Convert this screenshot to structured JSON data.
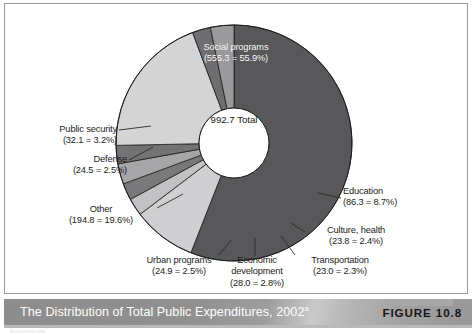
{
  "figure": {
    "caption": "The Distribution of Total Public Expenditures, 2002",
    "caption_superscript": "a",
    "number_label": "FIGURE 10.8",
    "footnote_ghost": "Expenditures"
  },
  "center": {
    "value": "992.7",
    "label": "Total"
  },
  "colors": {
    "social_programs": "#58585a",
    "public_security": "#9a9a9c",
    "defense": "#6e6e70",
    "other": "#d4d4d4",
    "urban_programs": "#737375",
    "economic_development": "#a6a6a8",
    "transportation": "#79797b",
    "culture_health": "#c2c2c4",
    "education": "#cfcfd1",
    "frame_border": "#9a9a9a",
    "caption_text": "#ffffff",
    "figure_number": "#161616"
  },
  "chart_data": {
    "type": "pie",
    "title": "The Distribution of Total Public Expenditures, 2002",
    "subtitle": "",
    "xlabel": "",
    "ylabel": "",
    "units": "billions",
    "total": 992.7,
    "total_label": "Total",
    "donut": true,
    "legend_position": "callout-labels",
    "grid": false,
    "categories": [
      "Social programs",
      "Education",
      "Culture, health",
      "Transportation",
      "Economic development",
      "Urban programs",
      "Other",
      "Defense",
      "Public security"
    ],
    "values": [
      555.3,
      86.3,
      23.8,
      23.0,
      28.0,
      24.9,
      194.8,
      24.5,
      32.1
    ],
    "percentages": [
      55.9,
      8.7,
      2.4,
      2.3,
      2.8,
      2.5,
      19.6,
      2.5,
      3.2
    ],
    "slices": [
      {
        "name": "Social programs",
        "value": 555.3,
        "percent": 55.9,
        "value_text": "555.3",
        "percent_text": "55.9%",
        "label_line1": "Social programs",
        "label_line2": "(555.3 = 55.9%)",
        "color": "#58585a",
        "label_placement": "inside"
      },
      {
        "name": "Education",
        "value": 86.3,
        "percent": 8.7,
        "value_text": "86.3",
        "percent_text": "8.7%",
        "label_line1": "Education",
        "label_line2": "(86.3 = 8.7%)",
        "color": "#cfcfd1",
        "label_placement": "right"
      },
      {
        "name": "Culture, health",
        "value": 23.8,
        "percent": 2.4,
        "value_text": "23.8",
        "percent_text": "2.4%",
        "label_line1": "Culture, health",
        "label_line2": "(23.8 = 2.4%)",
        "color": "#c2c2c4",
        "label_placement": "right"
      },
      {
        "name": "Transportation",
        "value": 23.0,
        "percent": 2.3,
        "value_text": "23.0",
        "percent_text": "2.3%",
        "label_line1": "Transportation",
        "label_line2": "(23.0 = 2.3%)",
        "color": "#79797b",
        "label_placement": "bottom-right"
      },
      {
        "name": "Economic development",
        "value": 28.0,
        "percent": 2.8,
        "value_text": "28.0",
        "percent_text": "2.8%",
        "label_line1": "Economic",
        "label_line2": "development",
        "label_line3": "(28.0 = 2.8%)",
        "color": "#a6a6a8",
        "label_placement": "bottom"
      },
      {
        "name": "Urban programs",
        "value": 24.9,
        "percent": 2.5,
        "value_text": "24.9",
        "percent_text": "2.5%",
        "label_line1": "Urban programs",
        "label_line2": "(24.9 = 2.5%)",
        "color": "#737375",
        "label_placement": "bottom-left"
      },
      {
        "name": "Other",
        "value": 194.8,
        "percent": 19.6,
        "value_text": "194.8",
        "percent_text": "19.6%",
        "label_line1": "Other",
        "label_line2": "(194.8 = 19.6%)",
        "color": "#d4d4d4",
        "label_placement": "left"
      },
      {
        "name": "Defense",
        "value": 24.5,
        "percent": 2.5,
        "value_text": "24.5",
        "percent_text": "2.5%",
        "label_line1": "Defense",
        "label_line2": "(24.5 = 2.5%)",
        "color": "#6e6e70",
        "label_placement": "left"
      },
      {
        "name": "Public security",
        "value": 32.1,
        "percent": 3.2,
        "value_text": "32.1",
        "percent_text": "3.2%",
        "label_line1": "Public security",
        "label_line2": "(32.1 = 3.2%)",
        "color": "#9a9a9c",
        "label_placement": "left"
      }
    ]
  }
}
